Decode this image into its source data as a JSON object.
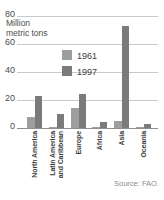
{
  "chart_data": {
    "type": "bar",
    "title": "",
    "ylabel_lines": [
      "Million",
      "metric tons"
    ],
    "ylabel": "Million metric tons",
    "categories": [
      [
        "North America"
      ],
      [
        "Latin America",
        "and Caribbean"
      ],
      [
        "Europe"
      ],
      [
        "Africa"
      ],
      [
        "Asia"
      ],
      [
        "Oceania"
      ]
    ],
    "series": [
      {
        "name": "1961",
        "color": "#9e9e9e",
        "values": [
          8,
          1,
          14,
          1,
          5,
          1
        ]
      },
      {
        "name": "1997",
        "color": "#7b7b7b",
        "values": [
          23,
          10,
          24,
          4,
          73,
          3
        ]
      }
    ],
    "yticks": [
      0,
      20,
      40,
      60,
      80
    ],
    "ylim": [
      0,
      80
    ],
    "grid": true,
    "legend_position": "upper-center",
    "source": "Source: FAO."
  },
  "colors": {
    "gridline": "#c9c9c9",
    "baseline": "#8f8f8f",
    "axis_text": "#4d4d4d",
    "category_text": "#3d3d3d",
    "source_text": "#8c8c8c",
    "background": "#ffffff"
  }
}
